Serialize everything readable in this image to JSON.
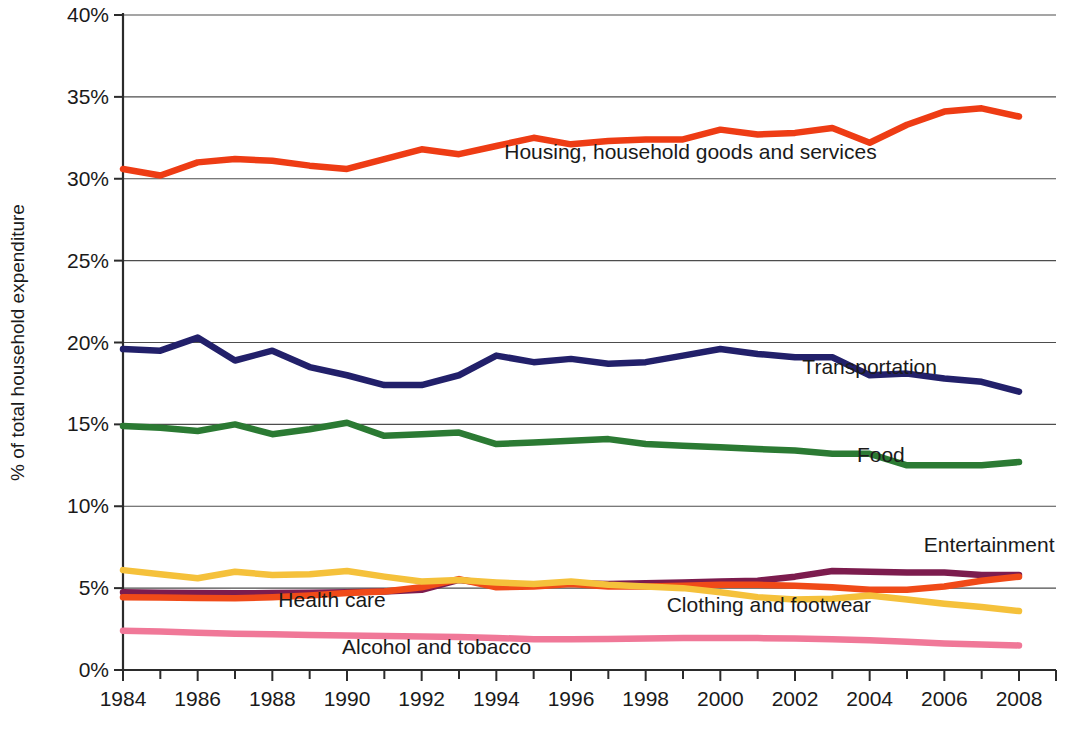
{
  "chart_data": {
    "type": "line",
    "title": "",
    "xlabel": "",
    "ylabel": "% of total household expenditure",
    "xlim": [
      1984,
      2008
    ],
    "ylim": [
      0,
      40
    ],
    "ytick_labels": [
      "0%",
      "5%",
      "10%",
      "15%",
      "20%",
      "25%",
      "30%",
      "35%",
      "40%"
    ],
    "ytick_values": [
      0,
      5,
      10,
      15,
      20,
      25,
      30,
      35,
      40
    ],
    "xtick_labels": [
      "1984",
      "1986",
      "1988",
      "1990",
      "1992",
      "1994",
      "1996",
      "1998",
      "2000",
      "2002",
      "2004",
      "2006",
      "2008"
    ],
    "xtick_values": [
      1984,
      1986,
      1988,
      1990,
      1992,
      1994,
      1996,
      1998,
      2000,
      2002,
      2004,
      2006,
      2008
    ],
    "grid": true,
    "legend_position": "inline-labels",
    "x": [
      1984,
      1985,
      1986,
      1987,
      1988,
      1989,
      1990,
      1991,
      1992,
      1993,
      1994,
      1995,
      1996,
      1997,
      1998,
      1999,
      2000,
      2001,
      2002,
      2003,
      2004,
      2005,
      2006,
      2007,
      2008
    ],
    "series": [
      {
        "name": "Housing, household goods and services",
        "color": "#EE3C14",
        "label_x": 1999.2,
        "label_y": 31.2,
        "label_anchor": "middle",
        "values": [
          30.6,
          30.2,
          31.0,
          31.2,
          31.1,
          30.8,
          30.6,
          31.2,
          31.8,
          31.5,
          32.0,
          32.5,
          32.1,
          32.3,
          32.4,
          32.4,
          33.0,
          32.7,
          32.8,
          33.1,
          32.2,
          33.3,
          34.1,
          34.3,
          33.8
        ]
      },
      {
        "name": "Transportation",
        "color": "#22206A",
        "label_x": 2004.0,
        "label_y": 18.1,
        "label_anchor": "middle",
        "values": [
          19.6,
          19.5,
          20.3,
          18.9,
          19.5,
          18.5,
          18.0,
          17.4,
          17.4,
          18.0,
          19.2,
          18.8,
          19.0,
          18.7,
          18.8,
          19.2,
          19.6,
          19.3,
          19.1,
          19.1,
          18.0,
          18.1,
          17.8,
          17.6,
          17.0
        ]
      },
      {
        "name": "Food",
        "color": "#2B7A33",
        "label_x": 2004.3,
        "label_y": 12.7,
        "label_anchor": "middle",
        "values": [
          14.9,
          14.8,
          14.6,
          15.0,
          14.4,
          14.7,
          15.1,
          14.3,
          14.4,
          14.5,
          13.8,
          13.9,
          14.0,
          14.1,
          13.8,
          13.7,
          13.6,
          13.5,
          13.4,
          13.2,
          13.2,
          12.5,
          12.5,
          12.5,
          12.7
        ]
      },
      {
        "name": "Entertainment",
        "color": "#7C1C4E",
        "label_x": 2007.2,
        "label_y": 7.2,
        "label_anchor": "middle",
        "values": [
          4.75,
          4.72,
          4.7,
          4.68,
          4.7,
          4.72,
          4.75,
          4.8,
          4.9,
          5.5,
          5.25,
          5.2,
          5.3,
          5.25,
          5.3,
          5.35,
          5.4,
          5.45,
          5.7,
          6.05,
          6.0,
          5.95,
          5.95,
          5.8,
          5.8
        ]
      },
      {
        "name": "Health care",
        "color": "#F04A18",
        "label_x": 1989.6,
        "label_y": 3.85,
        "label_anchor": "middle",
        "values": [
          4.45,
          4.42,
          4.4,
          4.38,
          4.45,
          4.55,
          4.7,
          4.8,
          5.05,
          5.55,
          5.05,
          5.1,
          5.25,
          5.1,
          5.1,
          5.15,
          5.2,
          5.2,
          5.15,
          5.05,
          4.9,
          4.9,
          5.1,
          5.45,
          5.7
        ]
      },
      {
        "name": "Clothing and footwear",
        "color": "#F5C13B",
        "label_x": 2001.3,
        "label_y": 3.55,
        "label_anchor": "middle",
        "values": [
          6.1,
          5.85,
          5.6,
          6.0,
          5.8,
          5.85,
          6.05,
          5.7,
          5.4,
          5.5,
          5.35,
          5.25,
          5.4,
          5.2,
          5.1,
          5.0,
          4.75,
          4.45,
          4.3,
          4.35,
          4.55,
          4.3,
          4.05,
          3.85,
          3.6
        ]
      },
      {
        "name": "Alcohol and tobacco",
        "color": "#F07898",
        "label_x": 1992.4,
        "label_y": 0.95,
        "label_anchor": "middle",
        "values": [
          2.4,
          2.35,
          2.28,
          2.22,
          2.18,
          2.14,
          2.1,
          2.08,
          2.05,
          2.02,
          1.96,
          1.88,
          1.88,
          1.9,
          1.92,
          1.95,
          1.96,
          1.95,
          1.92,
          1.88,
          1.82,
          1.72,
          1.62,
          1.55,
          1.5
        ]
      }
    ]
  }
}
